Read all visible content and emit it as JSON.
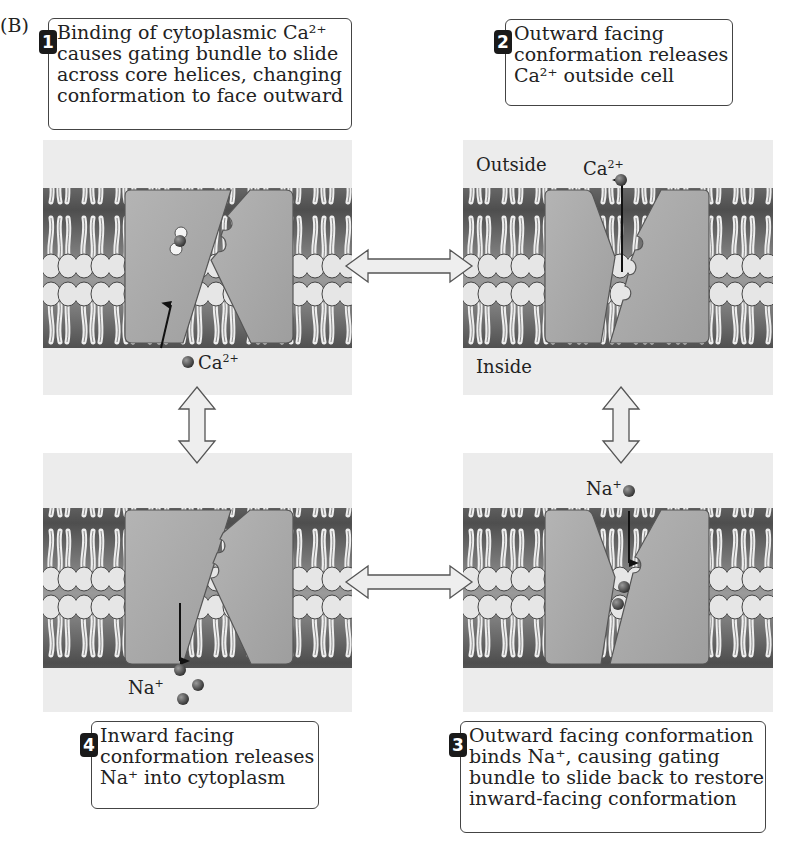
{
  "figure_label": "(B)",
  "steps": [
    {
      "number": "1",
      "lines": [
        "Binding of cytoplasmic Ca²⁺",
        "causes gating bundle to slide",
        "across core helices, changing",
        "conformation to face outward"
      ]
    },
    {
      "number": "2",
      "lines": [
        "Outward facing",
        "conformation releases",
        "Ca²⁺ outside cell"
      ]
    },
    {
      "number": "3",
      "lines": [
        "Outward facing conformation",
        "binds Na⁺, causing gating",
        "bundle to slide back to restore",
        "inward-facing conformation"
      ]
    },
    {
      "number": "4",
      "lines": [
        "Inward facing",
        "conformation releases",
        "Na⁺ into cytoplasm"
      ]
    }
  ],
  "panels": {
    "top_left": {
      "ion_label": "Ca²⁺",
      "state": "inward-facing, Ca²⁺ binding"
    },
    "top_right": {
      "ion_label": "Ca²⁺",
      "outside_label": "Outside",
      "inside_label": "Inside",
      "state": "outward-facing, Ca²⁺ release"
    },
    "bottom_right": {
      "ion_label": "Na⁺",
      "state": "outward-facing, Na⁺ binding"
    },
    "bottom_left": {
      "ion_label": "Na⁺",
      "state": "inward-facing, Na⁺ release"
    }
  },
  "colors": {
    "panel_bg": "#ececec",
    "protein": "#a9a9a9",
    "lipid_head": "#e3e3e3",
    "membrane_core": "#5a5a5a",
    "ion": "#4a4a4a",
    "badge": "#1a1a1a"
  }
}
